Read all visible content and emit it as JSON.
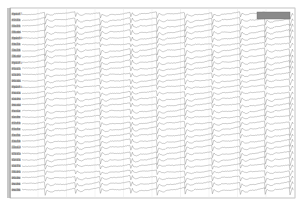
{
  "chart_data": {
    "type": "line",
    "title": "",
    "xlabel": "",
    "ylabel": "",
    "grid": true,
    "legend": "none",
    "scale_box": {
      "position": "top-right",
      "color": "#8a8a8a"
    },
    "channel_count": 30,
    "channels": [
      "Fp1-F7",
      "F7-T3",
      "T3-T5",
      "T5-O1",
      "Fp2-F8",
      "F8-T4",
      "T4-T6",
      "T6-O2",
      "Fp1-F3",
      "F3-C3",
      "C3-P3",
      "P3-O1",
      "Fp2-F4",
      "F4-C4",
      "C4-P4",
      "P4-O2",
      "Fz-Cz",
      "Cz-Pz",
      "F7-F3",
      "F3-Fz",
      "Fz-F4",
      "F4-F8",
      "T3-C3",
      "C3-Cz",
      "Cz-C4",
      "C4-T4",
      "T5-P3",
      "P3-Pz",
      "Pz-P4",
      "P4-T6"
    ],
    "discharge_x_px": [
      45,
      75,
      100,
      130,
      157,
      185,
      212,
      240,
      265,
      290
    ],
    "plot_area": {
      "x0": 10,
      "y0": 8,
      "x1": 295,
      "y1": 198
    },
    "colors": {
      "trace": "#6a6a6a",
      "frame": "#9a9a9a",
      "label_col": "#c8c8c8",
      "grid": "#e4e4e4"
    }
  }
}
